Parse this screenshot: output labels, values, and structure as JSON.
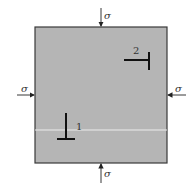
{
  "figure": {
    "stress_symbol": "σ",
    "labels": {
      "top": "σ",
      "bottom": "σ",
      "left": "σ",
      "right": "σ"
    },
    "dislocations": [
      {
        "id": "1",
        "label": "1",
        "orientation": "upright-perpendicular"
      },
      {
        "id": "2",
        "label": "2",
        "orientation": "rotated-perpendicular"
      }
    ],
    "colors": {
      "block_fill": "#b5b5b5",
      "block_border": "#3a3a3a",
      "arrow": "#222222",
      "dislocation": "#111111",
      "slip_line": "#e8e8e8"
    }
  }
}
